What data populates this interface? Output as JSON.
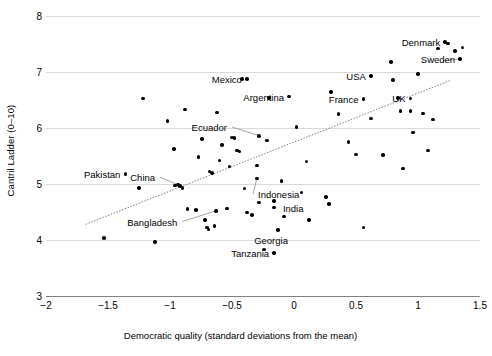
{
  "chart_data": {
    "type": "scatter",
    "title": "",
    "xlabel": "Democratic quality (standard deviations from the mean)",
    "ylabel": "Cantril Ladder (0–10)",
    "xlim": [
      -2,
      1.5
    ],
    "ylim": [
      3,
      8
    ],
    "xticks": [
      "−2",
      "−1.5",
      "−1",
      "−0.5",
      "0",
      "0.5",
      "1",
      "1.5"
    ],
    "xtick_values": [
      -2,
      -1.5,
      -1,
      -0.5,
      0,
      0.5,
      1,
      1.5
    ],
    "yticks": [
      "3",
      "4",
      "5",
      "6",
      "7",
      "8"
    ],
    "ytick_values": [
      3,
      4,
      5,
      6,
      7,
      8
    ],
    "grid": "horizontal",
    "legend": "none",
    "marker_color": "#000000",
    "gridline_color": "#d9d9d9",
    "axis_color": "#808080",
    "trendline": {
      "style": "dotted",
      "color": "#808080",
      "x_start": -1.68,
      "y_start": 4.28,
      "x_end": 1.26,
      "y_end": 6.85
    },
    "points": [
      {
        "x": -1.53,
        "y": 4.04,
        "label": null
      },
      {
        "x": -1.25,
        "y": 4.93,
        "label": null
      },
      {
        "x": -1.22,
        "y": 6.53,
        "label": null
      },
      {
        "x": -1.12,
        "y": 3.96,
        "label": null
      },
      {
        "x": -1.02,
        "y": 6.13,
        "label": null
      },
      {
        "x": -0.97,
        "y": 5.62,
        "label": null
      },
      {
        "x": -0.96,
        "y": 4.97,
        "label": null
      },
      {
        "x": -0.94,
        "y": 4.99,
        "label": null
      },
      {
        "x": -0.92,
        "y": 4.96,
        "label": null
      },
      {
        "x": -0.9,
        "y": 4.93,
        "label": null
      },
      {
        "x": -0.88,
        "y": 6.33,
        "label": null
      },
      {
        "x": -0.86,
        "y": 4.55,
        "label": null
      },
      {
        "x": -0.79,
        "y": 4.54,
        "label": null
      },
      {
        "x": -0.77,
        "y": 5.48,
        "label": null
      },
      {
        "x": -0.74,
        "y": 5.8,
        "label": null
      },
      {
        "x": -0.72,
        "y": 4.36,
        "label": null
      },
      {
        "x": -0.7,
        "y": 4.22,
        "label": null
      },
      {
        "x": -0.69,
        "y": 4.19,
        "label": null
      },
      {
        "x": -0.68,
        "y": 5.22,
        "label": null
      },
      {
        "x": -0.66,
        "y": 5.2,
        "label": null
      },
      {
        "x": -0.64,
        "y": 4.25,
        "label": null
      },
      {
        "x": -0.62,
        "y": 6.28,
        "label": null
      },
      {
        "x": -0.6,
        "y": 5.42,
        "label": null
      },
      {
        "x": -0.58,
        "y": 5.7,
        "label": null
      },
      {
        "x": -0.54,
        "y": 4.56,
        "label": null
      },
      {
        "x": -0.52,
        "y": 5.31,
        "label": null
      },
      {
        "x": -0.5,
        "y": 5.83,
        "label": null
      },
      {
        "x": -0.48,
        "y": 5.82,
        "label": null
      },
      {
        "x": -0.46,
        "y": 5.6,
        "label": null
      },
      {
        "x": -0.44,
        "y": 5.58,
        "label": null
      },
      {
        "x": -0.42,
        "y": 6.88,
        "label": null
      },
      {
        "x": -0.4,
        "y": 4.92,
        "label": null
      },
      {
        "x": -0.38,
        "y": 4.49,
        "label": null
      },
      {
        "x": -0.34,
        "y": 4.45,
        "label": null
      },
      {
        "x": -0.3,
        "y": 5.33,
        "label": null
      },
      {
        "x": -0.28,
        "y": 4.67,
        "label": null
      },
      {
        "x": -0.24,
        "y": 3.83,
        "label": null
      },
      {
        "x": -0.22,
        "y": 5.78,
        "label": null
      },
      {
        "x": -0.2,
        "y": 6.54,
        "label": null
      },
      {
        "x": -0.16,
        "y": 4.7,
        "label": null
      },
      {
        "x": -0.1,
        "y": 5.05,
        "label": null
      },
      {
        "x": -0.08,
        "y": 4.42,
        "label": null
      },
      {
        "x": 0.02,
        "y": 6.02,
        "label": null
      },
      {
        "x": 0.06,
        "y": 4.85,
        "label": null
      },
      {
        "x": 0.1,
        "y": 5.4,
        "label": null
      },
      {
        "x": 0.12,
        "y": 4.36,
        "label": null
      },
      {
        "x": 0.26,
        "y": 4.77,
        "label": null
      },
      {
        "x": 0.28,
        "y": 4.64,
        "label": null
      },
      {
        "x": 0.3,
        "y": 6.64,
        "label": null
      },
      {
        "x": 0.36,
        "y": 6.25,
        "label": null
      },
      {
        "x": 0.44,
        "y": 5.75,
        "label": null
      },
      {
        "x": 0.5,
        "y": 5.53,
        "label": null
      },
      {
        "x": 0.56,
        "y": 4.22,
        "label": null
      },
      {
        "x": 0.62,
        "y": 6.17,
        "label": null
      },
      {
        "x": 0.72,
        "y": 5.52,
        "label": null
      },
      {
        "x": 0.78,
        "y": 7.18,
        "label": null
      },
      {
        "x": 0.8,
        "y": 6.86,
        "label": null
      },
      {
        "x": 0.84,
        "y": 6.54,
        "label": null
      },
      {
        "x": 0.86,
        "y": 6.3,
        "label": null
      },
      {
        "x": 0.88,
        "y": 5.28,
        "label": null
      },
      {
        "x": 0.94,
        "y": 6.3,
        "label": null
      },
      {
        "x": 0.96,
        "y": 5.92,
        "label": null
      },
      {
        "x": 1.0,
        "y": 6.96,
        "label": null
      },
      {
        "x": 1.04,
        "y": 6.26,
        "label": null
      },
      {
        "x": 1.08,
        "y": 5.6,
        "label": null
      },
      {
        "x": 1.12,
        "y": 6.15,
        "label": null
      },
      {
        "x": 1.16,
        "y": 7.42,
        "label": null
      },
      {
        "x": 1.24,
        "y": 7.51,
        "label": null
      },
      {
        "x": 1.3,
        "y": 7.38,
        "label": null
      },
      {
        "x": 1.36,
        "y": 7.44,
        "label": null
      }
    ],
    "labeled_points": [
      {
        "name": "Pakistan",
        "x": -1.36,
        "y": 5.18,
        "label_side": "left"
      },
      {
        "name": "China",
        "x": -0.93,
        "y": 4.98,
        "label_side": "above-left",
        "label_x": -1.08,
        "label_y": 5.12,
        "leader": true
      },
      {
        "name": "Bangladesh",
        "x": -0.63,
        "y": 4.52,
        "label_side": "below-left",
        "label_x": -0.9,
        "label_y": 4.33,
        "leader": true
      },
      {
        "name": "Mexico",
        "x": -0.38,
        "y": 6.88,
        "label_side": "left"
      },
      {
        "name": "Ecuador",
        "x": -0.28,
        "y": 5.86,
        "label_side": "above-left",
        "label_x": -0.5,
        "label_y": 6.02,
        "leader": true
      },
      {
        "name": "Indonesia",
        "x": -0.3,
        "y": 5.1,
        "label_side": "below-right",
        "label_x": -0.33,
        "label_y": 4.82,
        "leader": true
      },
      {
        "name": "India",
        "x": -0.16,
        "y": 4.58,
        "label_side": "right",
        "label_x": -0.13,
        "label_y": 4.58,
        "leader": false
      },
      {
        "name": "Georgia",
        "x": -0.13,
        "y": 4.18,
        "label_side": "below",
        "label_x": -0.16,
        "label_y": 4.0,
        "leader": false
      },
      {
        "name": "Tanzania",
        "x": -0.16,
        "y": 3.77,
        "label_side": "left"
      },
      {
        "name": "Argentina",
        "x": -0.04,
        "y": 6.56,
        "label_side": "left"
      },
      {
        "name": "France",
        "x": 0.56,
        "y": 6.52,
        "label_side": "left"
      },
      {
        "name": "USA",
        "x": 0.62,
        "y": 6.93,
        "label_side": "left"
      },
      {
        "name": "UK",
        "x": 0.94,
        "y": 6.53,
        "label_side": "left"
      },
      {
        "name": "Denmark",
        "x": 1.22,
        "y": 7.54,
        "label_side": "left"
      },
      {
        "name": "Sweden",
        "x": 1.34,
        "y": 7.23,
        "label_side": "left",
        "leader": true,
        "leader_from_x": 1.2,
        "leader_from_y": 7.2
      }
    ]
  }
}
